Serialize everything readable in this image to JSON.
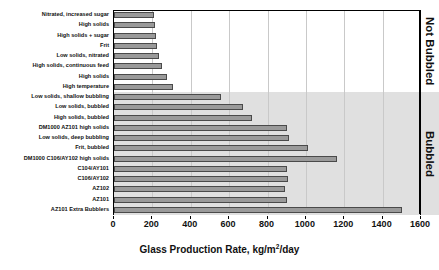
{
  "chart_data": {
    "type": "bar",
    "orientation": "horizontal",
    "title": "",
    "xlabel": "Glass Production Rate, kg/m2/day",
    "ylabel": "",
    "xlim": [
      0,
      1600
    ],
    "xticks": [
      0,
      200,
      400,
      600,
      800,
      1000,
      1200,
      1400,
      1600
    ],
    "grid": true,
    "grid_axis": "x",
    "legend": false,
    "bar_color": "#9a9a9a",
    "bar_edge_color": "#4a4a4a",
    "categories": [
      "Nitrated, increased sugar",
      "High solids",
      "High solids + sugar",
      "Frit",
      "Low solids, nitrated",
      "High solids, continuous feed",
      "High solids",
      "High temperature",
      "Low solids, shallow bubbling",
      "Low solids, bubbled",
      "High solids, bubbled",
      "DM1000 AZ101 high solids",
      "Low solids, deep bubbling",
      "Frit, bubbled",
      "DM1000 C106/AY102 high solids",
      "C104/AY101",
      "C106/AY102",
      "AZ102",
      "AZ101",
      "AZ101 Extra Bubblers"
    ],
    "values": [
      210,
      215,
      220,
      225,
      235,
      250,
      275,
      310,
      560,
      670,
      720,
      900,
      910,
      1010,
      1160,
      900,
      905,
      890,
      900,
      1500
    ],
    "annotations": [
      {
        "text": "Not Bubbled",
        "region_rows": [
          0,
          7
        ],
        "shaded": false,
        "background": "#ffffff"
      },
      {
        "text": "Bubbled",
        "region_rows": [
          8,
          19
        ],
        "shaded": true,
        "background": "#e0e0e0"
      }
    ]
  },
  "axis": {
    "x_title_main": "Glass Production Rate, kg/m",
    "x_title_sup": "2",
    "x_title_tail": "/day"
  },
  "side": {
    "not_bubbled": "Not Bubbled",
    "bubbled": "Bubbled"
  }
}
